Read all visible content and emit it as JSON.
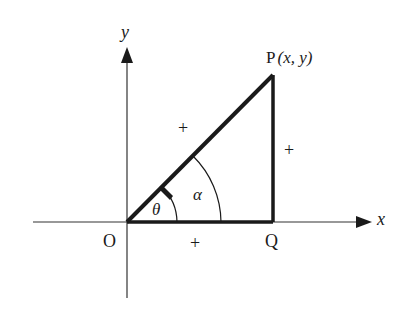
{
  "diagram": {
    "axes": {
      "x_label": "x",
      "y_label": "y"
    },
    "points": {
      "origin": "O",
      "p_name": "P",
      "p_coords": "(x, y)",
      "q": "Q"
    },
    "angles": {
      "theta": "θ",
      "alpha": "α"
    },
    "signs": {
      "hypotenuse": "+",
      "vertical_side": "+",
      "horizontal_side": "+"
    },
    "colors": {
      "line": "#1a1a1a",
      "axis": "#333333",
      "background": "#ffffff"
    }
  }
}
